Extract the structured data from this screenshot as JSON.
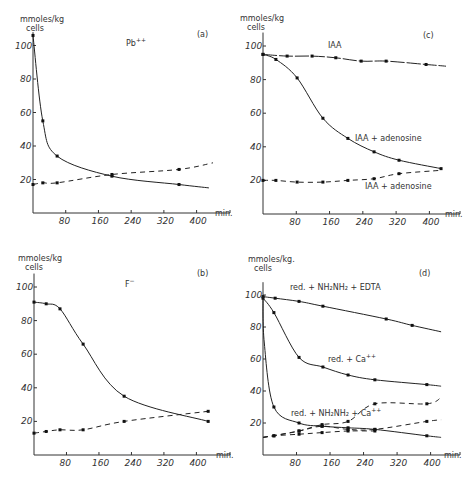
{
  "figure": {
    "panels_order": [
      "a",
      "c",
      "b",
      "d"
    ]
  },
  "chart_data": [
    {
      "id": "a",
      "type": "line",
      "panel_label": "(a)",
      "title": "Pb++",
      "ylabel_line1": "mmoles/kg",
      "ylabel_line2": "cells",
      "xlabel": "min.",
      "xticks": [
        80,
        160,
        240,
        320,
        400
      ],
      "yticks": [
        20,
        40,
        60,
        80,
        100
      ],
      "xlim": [
        0,
        440
      ],
      "ylim": [
        0,
        110
      ],
      "series": [
        {
          "name": "Pb++ solid",
          "style": "solid",
          "x": [
            0,
            24,
            59,
            193,
            357,
            430
          ],
          "y": [
            106,
            55,
            34,
            22,
            17,
            15
          ],
          "markers": [
            true,
            true,
            true,
            true,
            true,
            false
          ]
        },
        {
          "name": "Pb++ dashed",
          "style": "dashed",
          "x": [
            0,
            24,
            59,
            193,
            357,
            440
          ],
          "y": [
            17,
            18,
            18,
            23,
            26,
            30
          ],
          "markers": [
            true,
            true,
            true,
            true,
            true,
            false
          ]
        }
      ]
    },
    {
      "id": "c",
      "type": "line",
      "panel_label": "(c)",
      "title": "IAA",
      "ylabel_line1": "mmoles/kg",
      "ylabel_line2": "cells",
      "xlabel": "min.",
      "xticks": [
        80,
        160,
        240,
        320,
        400
      ],
      "yticks": [
        20,
        40,
        60,
        80,
        100
      ],
      "xlim": [
        0,
        440
      ],
      "ylim": [
        0,
        110
      ],
      "annotations": [
        "IAA + adenosine",
        "IAA + adenosine"
      ],
      "series": [
        {
          "name": "IAA",
          "style": "solid-dash",
          "x": [
            0,
            58,
            118,
            175,
            236,
            296,
            392,
            440
          ],
          "y": [
            95,
            94,
            94,
            93,
            91,
            91,
            89,
            88
          ],
          "markers": [
            true,
            true,
            true,
            true,
            true,
            true,
            true,
            false
          ]
        },
        {
          "name": "IAA + adenosine (solid)",
          "style": "solid",
          "x": [
            0,
            31,
            82,
            144,
            204,
            267,
            327,
            428
          ],
          "y": [
            95,
            92,
            81,
            57,
            45,
            37,
            32,
            27
          ],
          "markers": [
            true,
            true,
            true,
            true,
            true,
            true,
            true,
            true
          ]
        },
        {
          "name": "IAA + adenosine (dashed)",
          "style": "dashed",
          "x": [
            0,
            31,
            82,
            144,
            204,
            267,
            327,
            428
          ],
          "y": [
            20,
            20,
            19,
            19,
            20,
            21,
            24,
            26
          ],
          "markers": [
            true,
            true,
            true,
            true,
            true,
            true,
            true,
            false
          ]
        }
      ]
    },
    {
      "id": "b",
      "type": "line",
      "panel_label": "(b)",
      "title": "F⁻",
      "ylabel_line1": "mmoles/kg",
      "ylabel_line2": "cells",
      "xlabel": "min.",
      "xticks": [
        80,
        160,
        240,
        320,
        400
      ],
      "yticks": [
        20,
        40,
        60,
        80,
        100
      ],
      "xlim": [
        0,
        440
      ],
      "ylim": [
        0,
        110
      ],
      "series": [
        {
          "name": "F- solid",
          "style": "solid",
          "x": [
            0,
            30,
            64,
            121,
            222,
            429
          ],
          "y": [
            91,
            90,
            87,
            66,
            35,
            20
          ],
          "markers": [
            true,
            true,
            true,
            true,
            true,
            true
          ]
        },
        {
          "name": "F- dashed",
          "style": "dashed",
          "x": [
            0,
            30,
            64,
            121,
            222,
            429
          ],
          "y": [
            13,
            14,
            15,
            15,
            20,
            26
          ],
          "markers": [
            true,
            true,
            true,
            true,
            true,
            true
          ]
        }
      ]
    },
    {
      "id": "d",
      "type": "line",
      "panel_label": "(d)",
      "title": "",
      "ylabel_line1": "mmoles/kg.",
      "ylabel_line2": "cells",
      "xlabel": "min.",
      "xticks": [
        80,
        160,
        240,
        320,
        400
      ],
      "yticks": [
        20,
        40,
        60,
        80,
        100
      ],
      "xlim": [
        0,
        440
      ],
      "ylim": [
        0,
        110
      ],
      "series": [
        {
          "name": "red. + NH2NH2 + EDTA",
          "style": "solid",
          "x": [
            0,
            29,
            86,
            143,
            294,
            356,
            425
          ],
          "y": [
            99,
            98,
            96,
            93,
            85,
            81,
            77
          ],
          "markers": [
            true,
            true,
            true,
            true,
            true,
            true,
            false
          ]
        },
        {
          "name": "red. + Ca++",
          "style": "solid",
          "x": [
            0,
            26,
            86,
            143,
            203,
            267,
            391,
            425
          ],
          "y": [
            98,
            89,
            61,
            55,
            50,
            47,
            44,
            43
          ],
          "markers": [
            true,
            true,
            true,
            true,
            true,
            true,
            true,
            false
          ]
        },
        {
          "name": "red. + NH2NH2 + Ca++ (solid)",
          "style": "solid",
          "x": [
            0,
            3,
            26,
            86,
            141,
            203,
            267,
            391,
            425
          ],
          "y": [
            100,
            70,
            30,
            20,
            18,
            17,
            16,
            12,
            11
          ],
          "markers": [
            false,
            false,
            true,
            true,
            true,
            true,
            true,
            true,
            false
          ]
        },
        {
          "name": "dashed upper",
          "style": "dashed",
          "x": [
            0,
            26,
            86,
            141,
            203,
            267,
            391,
            425
          ],
          "y": [
            11,
            12,
            15,
            19,
            21,
            32,
            32,
            36
          ],
          "markers": [
            false,
            true,
            true,
            true,
            true,
            true,
            true,
            false
          ]
        },
        {
          "name": "dashed middle",
          "style": "dashed",
          "x": [
            0,
            86,
            141,
            203,
            267,
            391,
            425
          ],
          "y": [
            11,
            15,
            18,
            16,
            16,
            21,
            22
          ],
          "markers": [
            false,
            true,
            true,
            true,
            true,
            true,
            false
          ]
        },
        {
          "name": "dashed lower",
          "style": "dashed",
          "x": [
            0,
            26,
            86,
            141,
            203,
            267
          ],
          "y": [
            11,
            12,
            13,
            14,
            15,
            15
          ],
          "markers": [
            false,
            true,
            true,
            true,
            true,
            true
          ]
        }
      ],
      "annotations": [
        "red. + NH₂NH₂ + EDTA",
        "red. + Ca⁺⁺",
        "red. + NH₂NH₂ + Ca⁺⁺"
      ]
    }
  ],
  "labels": {
    "a": {
      "panel": "(a)",
      "title": "Pb",
      "title_sup": "++",
      "ylab1": "mmoles/kg",
      "ylab2": "cells",
      "xunit": "min."
    },
    "c": {
      "panel": "(c)",
      "title": "IAA",
      "ann1": "IAA + adenosine",
      "ann2": "IAA + adenosine",
      "ylab1": "mmoles/kg",
      "ylab2": "cells",
      "xunit": "min."
    },
    "b": {
      "panel": "(b)",
      "title": "F",
      "title_sup": "−",
      "ylab1": "mmoles/kg",
      "ylab2": "cells",
      "xunit": "min."
    },
    "d": {
      "panel": "(d)",
      "ann_edta": "red. + NH₂NH₂ + EDTA",
      "ann_ca": "red. + Ca",
      "ann_ca_sup": "++",
      "ann_hyd_ca": "red. + NH₂NH₂ + Ca",
      "ann_hyd_ca_sup": "++",
      "ylab1": "mmoles/kg.",
      "ylab2": "cells",
      "xunit": "min."
    },
    "xticks": [
      "80",
      "160",
      "240",
      "320",
      "400"
    ],
    "yticks": [
      "20",
      "40",
      "60",
      "80",
      "100"
    ]
  }
}
